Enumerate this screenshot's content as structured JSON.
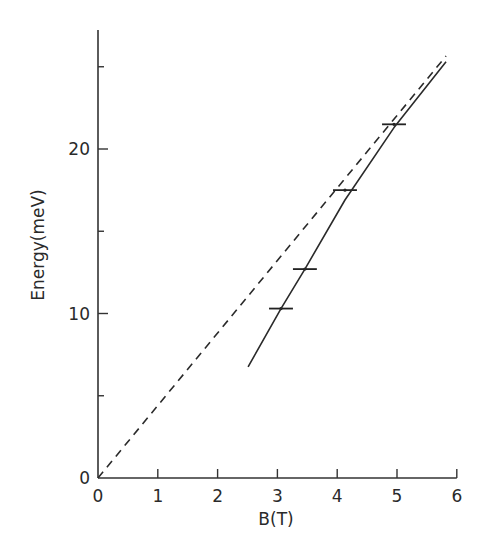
{
  "chart_data": {
    "type": "line",
    "title": "",
    "xlabel": "B(T)",
    "ylabel": "Energy(meV)",
    "xlim": [
      0,
      6
    ],
    "ylim": [
      0,
      27
    ],
    "grid": false,
    "legend": null,
    "x_ticks": [
      0,
      1,
      2,
      3,
      4,
      5,
      6
    ],
    "x_tick_labels": [
      "0",
      "1",
      "2",
      "3",
      "4",
      "5",
      "6"
    ],
    "y_ticks_major": [
      0,
      10,
      20
    ],
    "y_tick_labels": [
      "0",
      "10",
      "20"
    ],
    "y_ticks_minor": [
      5,
      15,
      25
    ],
    "series": [
      {
        "name": "data points (with horizontal error bars)",
        "style": "markers-with-xerr",
        "points": [
          {
            "x": 3.06,
            "y": 10.3,
            "xerr": 0.2
          },
          {
            "x": 3.46,
            "y": 12.7,
            "xerr": 0.2
          },
          {
            "x": 4.13,
            "y": 17.5,
            "xerr": 0.2
          },
          {
            "x": 4.95,
            "y": 21.5,
            "xerr": 0.2
          }
        ]
      },
      {
        "name": "solid fit curve",
        "style": "solid",
        "x": [
          2.51,
          3.06,
          3.46,
          4.13,
          4.95,
          5.82
        ],
        "y": [
          6.75,
          10.3,
          12.7,
          16.9,
          21.3,
          25.3
        ]
      },
      {
        "name": "dashed reference line",
        "style": "dashed",
        "x": [
          0,
          5.82
        ],
        "y": [
          0,
          25.65
        ]
      }
    ]
  }
}
